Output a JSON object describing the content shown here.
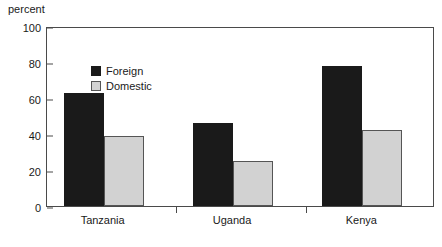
{
  "chart_data": {
    "type": "bar",
    "title": "",
    "subtitle": "",
    "xlabel": "",
    "ylabel": "percent",
    "ylim": [
      0,
      100
    ],
    "yticks": [
      0,
      20,
      40,
      60,
      80,
      100
    ],
    "grid": false,
    "legend_position": "inside top-left",
    "categories": [
      "Tanzania",
      "Uganda",
      "Kenya"
    ],
    "series": [
      {
        "name": "Foreign",
        "color": "#1a1a1a",
        "values": [
          63,
          46,
          78
        ]
      },
      {
        "name": "Domestic",
        "color": "#d2d2d2",
        "values": [
          39,
          25,
          42
        ]
      }
    ]
  },
  "axis": {
    "unit_label": "percent",
    "tick_labels": [
      "100",
      "80",
      "60",
      "40",
      "20",
      "0"
    ]
  },
  "legend": {
    "items": [
      {
        "label": "Foreign"
      },
      {
        "label": "Domestic"
      }
    ]
  }
}
